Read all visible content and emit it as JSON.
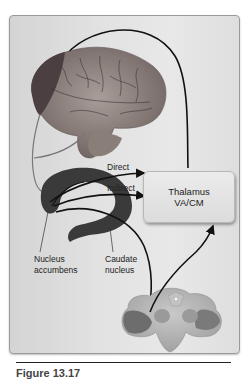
{
  "figure": {
    "labels": {
      "direct": "Direct",
      "indirect": "Indirect",
      "thalamus_line1": "Thalamus",
      "thalamus_line2": "VA/CM",
      "nucleus_accumbens_line1": "Nucleus",
      "nucleus_accumbens_line2": "accumbens",
      "caudate_line1": "Caudate",
      "caudate_line2": "nucleus"
    },
    "structures": [
      "cerebral-cortex",
      "striatum",
      "thalamus",
      "brainstem-midbrain"
    ],
    "pathways": [
      "cortex-to-striatum",
      "striatum-to-thalamus-direct",
      "striatum-to-thalamus-indirect",
      "striatum-to-midbrain",
      "midbrain-to-thalamus",
      "thalamus-to-cortex"
    ],
    "colors": {
      "panel_bg": "#e2e2e2",
      "arrow": "#111111",
      "striatum": "#3a3a3a",
      "brainstem": "#a9a9a9"
    }
  },
  "caption": "Figure 13.17"
}
